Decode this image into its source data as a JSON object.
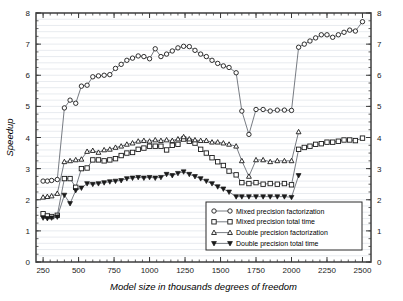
{
  "chart_data": {
    "type": "line",
    "title": "",
    "xlabel": "Model size in thousands degrees of freedom",
    "ylabel": "Speedup",
    "xlim": [
      200,
      2560
    ],
    "ylim": [
      0,
      8
    ],
    "xticks": [
      250,
      500,
      750,
      1000,
      1250,
      1500,
      1750,
      2000,
      2250,
      2500
    ],
    "yticks": [
      0,
      1,
      2,
      3,
      4,
      5,
      6,
      7,
      8
    ],
    "grid": true,
    "grid_minor_step": 0.2,
    "right_axis": true,
    "right_yticks": [
      0,
      1,
      2,
      3,
      4,
      5,
      6,
      7,
      8
    ],
    "legend_position": "lower-right",
    "series": [
      {
        "name": "Mixed precision factorization",
        "marker": "open-circle",
        "x": [
          250,
          280,
          310,
          350,
          400,
          440,
          480,
          520,
          560,
          600,
          640,
          680,
          720,
          760,
          800,
          840,
          880,
          920,
          960,
          1000,
          1040,
          1080,
          1120,
          1160,
          1200,
          1240,
          1280,
          1320,
          1360,
          1400,
          1440,
          1480,
          1520,
          1560,
          1610,
          1650,
          1700,
          1750,
          1800,
          1850,
          1900,
          1950,
          2000,
          2050,
          2090,
          2130,
          2170,
          2210,
          2250,
          2290,
          2330,
          2370,
          2410,
          2450,
          2500
        ],
        "y": [
          2.6,
          2.6,
          2.62,
          2.65,
          4.95,
          5.2,
          5.1,
          5.65,
          5.68,
          5.95,
          5.98,
          6.0,
          6.02,
          6.22,
          6.35,
          6.48,
          6.55,
          6.62,
          6.6,
          6.53,
          6.85,
          6.6,
          6.68,
          6.78,
          6.88,
          6.93,
          6.92,
          6.8,
          6.68,
          6.6,
          6.48,
          6.38,
          6.3,
          6.25,
          6.08,
          4.85,
          4.1,
          4.9,
          4.9,
          4.85,
          4.88,
          4.88,
          4.87,
          6.9,
          7.0,
          7.1,
          7.2,
          7.3,
          7.3,
          7.22,
          7.3,
          7.38,
          7.45,
          7.42,
          7.72
        ]
      },
      {
        "name": "Mixed precision total time",
        "marker": "open-square",
        "x": [
          250,
          280,
          310,
          350,
          400,
          440,
          480,
          520,
          560,
          600,
          640,
          680,
          720,
          760,
          800,
          840,
          880,
          920,
          960,
          1000,
          1040,
          1080,
          1120,
          1160,
          1200,
          1240,
          1280,
          1320,
          1360,
          1400,
          1440,
          1480,
          1520,
          1560,
          1610,
          1650,
          1700,
          1750,
          1800,
          1850,
          1900,
          1950,
          2000,
          2050,
          2090,
          2130,
          2170,
          2210,
          2250,
          2290,
          2330,
          2370,
          2410,
          2450,
          2500
        ],
        "y": [
          1.55,
          1.48,
          1.46,
          1.5,
          2.68,
          2.68,
          2.4,
          3.0,
          3.02,
          3.28,
          3.28,
          3.25,
          3.28,
          3.32,
          3.42,
          3.5,
          3.52,
          3.62,
          3.66,
          3.72,
          3.72,
          3.72,
          3.6,
          3.75,
          3.78,
          3.95,
          3.88,
          3.82,
          3.62,
          3.5,
          3.35,
          3.22,
          3.1,
          2.92,
          2.8,
          2.55,
          2.52,
          2.55,
          2.5,
          2.52,
          2.5,
          2.52,
          2.48,
          3.62,
          3.68,
          3.72,
          3.78,
          3.8,
          3.85,
          3.85,
          3.88,
          3.92,
          3.92,
          3.9,
          3.98
        ]
      },
      {
        "name": "Double precision factorization",
        "marker": "open-triangle-up",
        "x": [
          250,
          280,
          310,
          350,
          400,
          440,
          480,
          520,
          560,
          600,
          640,
          680,
          720,
          760,
          800,
          840,
          880,
          920,
          960,
          1000,
          1040,
          1080,
          1120,
          1160,
          1200,
          1240,
          1280,
          1320,
          1360,
          1400,
          1440,
          1480,
          1520,
          1560,
          1610,
          1650,
          1700,
          1750,
          1800,
          1850,
          1900,
          1950,
          2000,
          2050
        ],
        "y": [
          2.08,
          2.1,
          2.12,
          2.2,
          3.22,
          3.25,
          3.28,
          3.3,
          3.55,
          3.58,
          3.52,
          3.6,
          3.62,
          3.68,
          3.72,
          3.78,
          3.82,
          3.88,
          3.9,
          3.88,
          3.92,
          3.9,
          3.92,
          3.9,
          3.95,
          4.02,
          3.95,
          3.92,
          3.9,
          3.9,
          3.85,
          3.85,
          3.82,
          3.78,
          3.72,
          3.25,
          2.75,
          3.28,
          3.28,
          3.22,
          3.25,
          3.25,
          3.25,
          4.18
        ]
      },
      {
        "name": "Double precision total time",
        "marker": "filled-triangle-down",
        "x": [
          250,
          280,
          310,
          350,
          400,
          440,
          480,
          520,
          560,
          600,
          640,
          680,
          720,
          760,
          800,
          840,
          880,
          920,
          960,
          1000,
          1040,
          1080,
          1120,
          1160,
          1200,
          1240,
          1280,
          1320,
          1360,
          1400,
          1440,
          1480,
          1520,
          1560,
          1610,
          1650,
          1700,
          1750,
          1800,
          1850,
          1900,
          1950,
          2000,
          2050
        ],
        "y": [
          1.42,
          1.4,
          1.42,
          1.45,
          2.15,
          1.88,
          2.3,
          2.38,
          2.52,
          2.5,
          2.52,
          2.55,
          2.58,
          2.6,
          2.62,
          2.68,
          2.7,
          2.72,
          2.7,
          2.72,
          2.7,
          2.72,
          2.82,
          2.78,
          2.85,
          2.9,
          2.82,
          2.75,
          2.68,
          2.6,
          2.52,
          2.42,
          2.35,
          2.25,
          2.1,
          2.1,
          2.1,
          2.1,
          2.1,
          2.1,
          2.1,
          2.1,
          2.08,
          2.78
        ]
      }
    ]
  },
  "colors": {
    "line": "#555b63",
    "marker_stroke": "#1a1a1a",
    "grid": "#d9dde4",
    "axis": "#4a4a4a",
    "background": "#ffffff"
  }
}
